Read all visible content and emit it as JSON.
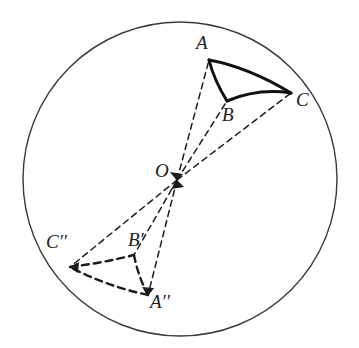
{
  "figure": {
    "background_color": "#ffffff",
    "stroke_color": "#1c1c1c"
  },
  "circle": {
    "name": "bounding-circle",
    "cx": 180,
    "cy": 179,
    "r": 157,
    "stroke": "#3a3a3a",
    "stroke_width": 1.4,
    "fill": "none",
    "style": "solid"
  },
  "center": {
    "name": "O",
    "label": "O",
    "x": 177,
    "y": 180,
    "marker": "arrowhead-cluster"
  },
  "points": [
    {
      "name": "A",
      "label": "A",
      "x": 209,
      "y": 60,
      "group": "original"
    },
    {
      "name": "B",
      "label": "B",
      "x": 227,
      "y": 101,
      "group": "original"
    },
    {
      "name": "C",
      "label": "C",
      "x": 291,
      "y": 93,
      "group": "original"
    },
    {
      "name": "Cpp",
      "label": "C′′",
      "x": 70,
      "y": 267,
      "group": "image"
    },
    {
      "name": "Bp",
      "label": "B′",
      "x": 134,
      "y": 255,
      "group": "image"
    },
    {
      "name": "App",
      "label": "A′′",
      "x": 148,
      "y": 295,
      "group": "image"
    }
  ],
  "triangles": [
    {
      "name": "triangle-ABC",
      "vertices": [
        "A",
        "B",
        "C"
      ],
      "style": "solid",
      "stroke_width": 3.0,
      "stroke": "#111111",
      "edges_curved": true
    },
    {
      "name": "triangle-App-Bp-Cpp",
      "vertices": [
        "C′′",
        "B′",
        "A′′"
      ],
      "style": "dashed",
      "stroke_width": 2.4,
      "stroke": "#1c1c1c",
      "edges_curved": true
    }
  ],
  "rays": [
    {
      "name": "ray-O-A",
      "from": "O",
      "to": "A",
      "style": "dashed"
    },
    {
      "name": "ray-O-B",
      "from": "O",
      "to": "B",
      "style": "dashed"
    },
    {
      "name": "ray-O-C",
      "from": "O",
      "to": "C",
      "style": "dashed"
    },
    {
      "name": "ray-O-Cpp",
      "from": "O",
      "to": "C′′",
      "style": "dashed"
    },
    {
      "name": "ray-O-Bp",
      "from": "O",
      "to": "B′",
      "style": "dashed"
    },
    {
      "name": "ray-O-App",
      "from": "O",
      "to": "A′′",
      "style": "dashed"
    }
  ],
  "labels": {
    "A": "A",
    "B": "B",
    "C": "C",
    "O": "O",
    "Cpp": "C′′",
    "Bp": "B′",
    "App": "A′′"
  }
}
